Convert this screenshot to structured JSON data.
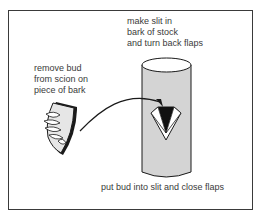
{
  "diagram": {
    "labels": {
      "slit": "make slit in\nbark of stock\nand turn back flaps",
      "bud": "remove bud\nfrom scion on\npiece of bark",
      "close": "put bud into slit and close flaps"
    },
    "elements": [
      "bark-shield-with-bud",
      "curved-arrow",
      "stock-cylinder",
      "t-slit-with-flaps"
    ],
    "colors": {
      "stroke": "#1a1a1a",
      "cylinder_fill": "#d4d4d4",
      "shield_fill": "#e6e6e6",
      "text": "#3a3a3a"
    }
  }
}
